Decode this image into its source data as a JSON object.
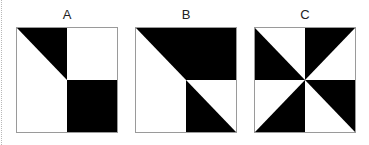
{
  "figure": {
    "colors": {
      "fill": "#000000",
      "background": "#ffffff",
      "border": "#9a9a9a"
    },
    "options": [
      {
        "label": "A",
        "quadrants": {
          "top_left": "upper-right triangle black",
          "top_right": "white",
          "bottom_left": "white",
          "bottom_right": "solid black"
        }
      },
      {
        "label": "B",
        "quadrants": {
          "top_left": "upper-right triangle black",
          "top_right": "solid black",
          "bottom_left": "white",
          "bottom_right": "lower-left triangle black"
        }
      },
      {
        "label": "C",
        "quadrants": {
          "top_left": "lower-left triangle black",
          "top_right": "upper-left triangle black",
          "bottom_left": "lower-right triangle black",
          "bottom_right": "upper-right triangle black"
        }
      }
    ]
  }
}
